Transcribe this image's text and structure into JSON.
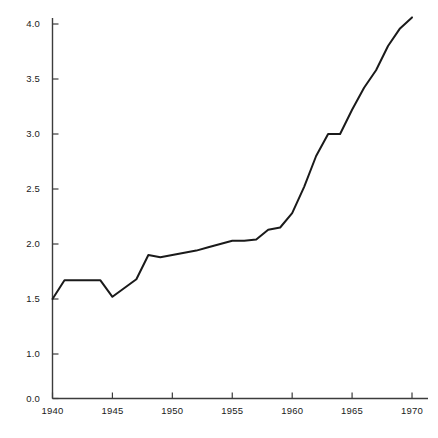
{
  "chart_data": {
    "type": "line",
    "title": "",
    "subtitle": "",
    "xlabel": "",
    "ylabel": "",
    "xlim": [
      1940,
      1970
    ],
    "ylim": [
      0.0,
      4.2
    ],
    "grid": false,
    "legend": null,
    "axis_break": true,
    "y_ticks": [
      0.0,
      1.0,
      1.5,
      2.0,
      2.5,
      3.0,
      3.5,
      4.0
    ],
    "y_tick_labels": [
      "0.0",
      "1.0",
      "1.5",
      "2.0",
      "2.5",
      "3.0",
      "3.5",
      "4.0"
    ],
    "x_ticks": [
      1940,
      1945,
      1950,
      1955,
      1960,
      1965,
      1970
    ],
    "x_tick_labels": [
      "1940",
      "1945",
      "1950",
      "1955",
      "1960",
      "1965",
      "1970"
    ],
    "series": [
      {
        "name": "value",
        "color": "#1a1a1a",
        "line_width": 2,
        "x": [
          1940,
          1941,
          1942,
          1943,
          1944,
          1945,
          1946,
          1947,
          1948,
          1949,
          1950,
          1951,
          1952,
          1953,
          1954,
          1955,
          1956,
          1957,
          1958,
          1959,
          1960,
          1961,
          1962,
          1963,
          1964,
          1965,
          1966,
          1967,
          1968,
          1969,
          1970
        ],
        "values": [
          1.5,
          1.67,
          1.67,
          1.67,
          1.67,
          1.52,
          1.6,
          1.68,
          1.9,
          1.88,
          1.9,
          1.92,
          1.94,
          1.97,
          2.0,
          2.03,
          2.03,
          2.04,
          2.13,
          2.15,
          2.28,
          2.52,
          2.8,
          3.0,
          3.0,
          3.22,
          3.42,
          3.58,
          3.8,
          3.96,
          4.06
        ]
      }
    ]
  },
  "axes": {
    "y_axis_name": "y-axis",
    "x_axis_name": "x-axis",
    "axis_color": "#3c3c3c"
  }
}
